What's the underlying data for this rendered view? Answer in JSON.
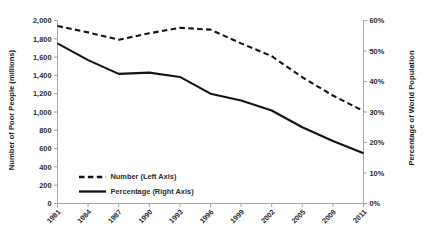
{
  "chart_data": {
    "type": "line",
    "title": "",
    "subtitle": "",
    "xlabel": "",
    "ylabel": "Number of Poor People (millions)",
    "y2label": "Percentage of World Population",
    "categories": [
      "1981",
      "1984",
      "1987",
      "1990",
      "1993",
      "1996",
      "1999",
      "2002",
      "2005",
      "2008",
      "2011"
    ],
    "x": [
      1981,
      1984,
      1987,
      1990,
      1993,
      1996,
      1999,
      2002,
      2005,
      2008,
      2011
    ],
    "ylim": [
      0,
      2000
    ],
    "ytick_step": 200,
    "ytick_labels": [
      "0",
      "200",
      "400",
      "600",
      "800",
      "1,000",
      "1,200",
      "1,400",
      "1,600",
      "1,800",
      "2,000"
    ],
    "ytick_values": [
      0,
      200,
      400,
      600,
      800,
      1000,
      1200,
      1400,
      1600,
      1800,
      2000
    ],
    "y2lim": [
      0,
      60
    ],
    "y2tick_step": 10,
    "y2tick_labels": [
      "0%",
      "10%",
      "20%",
      "30%",
      "40%",
      "50%",
      "60%"
    ],
    "y2tick_values": [
      0,
      10,
      20,
      30,
      40,
      50,
      60
    ],
    "grid": false,
    "legend_position": "inside-lower-left",
    "series": [
      {
        "name": "Number (Left Axis)",
        "axis": "left",
        "style": "dashed",
        "color": "#141414",
        "values": [
          1940,
          1870,
          1790,
          1860,
          1920,
          1900,
          1750,
          1610,
          1380,
          1180,
          1010
        ]
      },
      {
        "name": "Percentage (Right Axis)",
        "axis": "right",
        "style": "solid",
        "color": "#141414",
        "values": [
          52.5,
          47.0,
          42.5,
          42.9,
          41.5,
          36.0,
          33.8,
          30.5,
          25.0,
          20.5,
          16.5
        ]
      }
    ],
    "legend": [
      {
        "label": "Number (Left Axis)",
        "style": "dashed"
      },
      {
        "label": "Percentage (Right Axis)",
        "style": "solid"
      }
    ]
  }
}
